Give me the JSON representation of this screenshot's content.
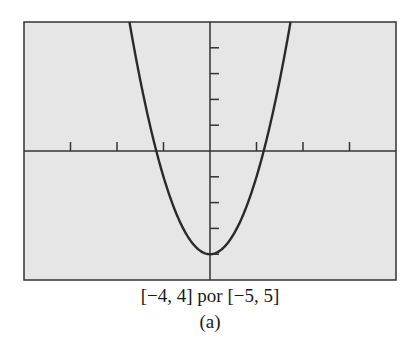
{
  "chart_data": {
    "type": "line",
    "function": "y = 3x^2 - 4",
    "window": {
      "xmin": -4,
      "xmax": 4,
      "ymin": -5,
      "ymax": 5
    },
    "xscale": 1,
    "yscale": 1,
    "grid": false,
    "series": [
      {
        "name": "parabola",
        "x": [
          -1.73,
          -1.5,
          -1.155,
          -1,
          -0.5,
          0,
          0.5,
          1,
          1.155,
          1.5,
          1.73
        ],
        "y": [
          5,
          2.75,
          0,
          -1,
          -3.25,
          -4,
          -3.25,
          -1,
          0,
          2.75,
          5
        ]
      }
    ],
    "title": "",
    "xlabel": "",
    "ylabel": "",
    "caption": "[−4, 4] por [−5, 5]",
    "sublabel": "(a)",
    "colors": {
      "background": "#e6e6e6",
      "line": "#2a2a2a",
      "frame": "#333333"
    }
  },
  "caption": {
    "window_text": "[−4, 4] por [−5, 5]",
    "panel_label": "(a)"
  }
}
